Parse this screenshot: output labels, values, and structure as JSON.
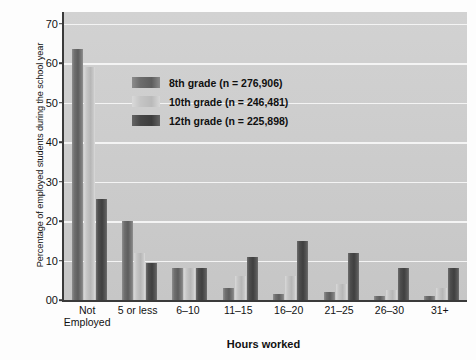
{
  "chart_data": {
    "type": "bar",
    "title": "",
    "xlabel": "Hours worked",
    "ylabel": "Percentage of employed students during the school year",
    "categories": [
      "Not\nEmployed",
      "5 or less",
      "6–10",
      "11–15",
      "16–20",
      "21–25",
      "26–30",
      "31+"
    ],
    "series": [
      {
        "name": "8th grade (n = 276,906)",
        "values": [
          63.5,
          20,
          8,
          3,
          1.5,
          2,
          1,
          1
        ],
        "color": "#6b6b6b"
      },
      {
        "name": "10th grade (n = 246,481)",
        "values": [
          59,
          12,
          8,
          6,
          6,
          4,
          2.5,
          3
        ],
        "color": "#c4c4c4"
      },
      {
        "name": "12th grade (n = 225,898)",
        "values": [
          25.5,
          9.5,
          8,
          11,
          15,
          12,
          8,
          8
        ],
        "color": "#454545"
      }
    ],
    "ylim": [
      0,
      73
    ],
    "yticks": [
      0,
      10,
      20,
      30,
      40,
      50,
      60,
      70
    ],
    "ytick_labels": [
      "00",
      "10",
      "20",
      "30",
      "40",
      "50",
      "60",
      "70"
    ],
    "grid": true,
    "legend_position": "upper center"
  }
}
